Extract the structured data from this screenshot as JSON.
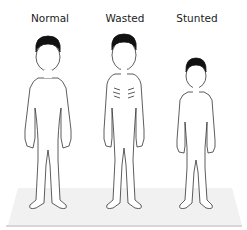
{
  "figure": {
    "labels": {
      "normal": "Normal",
      "wasted": "Wasted",
      "stunted": "Stunted"
    },
    "colors": {
      "outline": "#333333",
      "hair": "#111111",
      "floor": "#f0f0f0",
      "floor_edge": "#d8d8d8"
    }
  }
}
